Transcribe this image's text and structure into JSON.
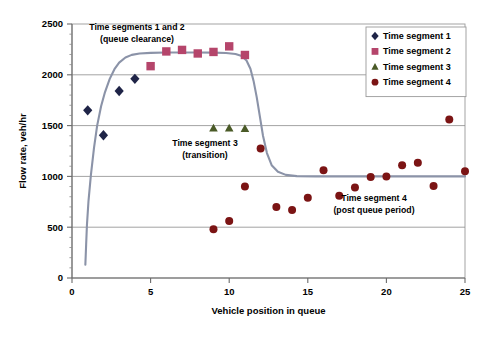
{
  "chart_data": {
    "type": "scatter",
    "title": "",
    "xlabel": "Vehicle position in queue",
    "ylabel": "Flow rate, veh/hr",
    "xlim": [
      0,
      25
    ],
    "ylim": [
      0,
      2500
    ],
    "xticks": [
      0,
      5,
      10,
      15,
      20,
      25
    ],
    "yticks": [
      0,
      500,
      1000,
      1500,
      2000,
      2500
    ],
    "xtick_labels": [
      "0",
      "5",
      "10",
      "15",
      "20",
      "25"
    ],
    "ytick_labels": [
      "0",
      "500",
      "1000",
      "1500",
      "2000",
      "2500"
    ],
    "grid": "horizontal",
    "legend_position": "top-right",
    "series": [
      {
        "name": "Time segment 1",
        "marker": "diamond",
        "color": "#1f2447",
        "points": [
          [
            1,
            1650
          ],
          [
            2,
            1405
          ],
          [
            3,
            1840
          ],
          [
            4,
            1960
          ]
        ]
      },
      {
        "name": "Time segment 2",
        "marker": "square",
        "color": "#b5456b",
        "points": [
          [
            5,
            2085
          ],
          [
            6,
            2230
          ],
          [
            7,
            2245
          ],
          [
            8,
            2210
          ],
          [
            9,
            2225
          ],
          [
            10,
            2280
          ],
          [
            11,
            2195
          ]
        ]
      },
      {
        "name": "Time segment 3",
        "marker": "triangle",
        "color": "#4a5a27",
        "points": [
          [
            9,
            1475
          ],
          [
            10,
            1475
          ],
          [
            11,
            1470
          ]
        ]
      },
      {
        "name": "Time segment 4",
        "marker": "circle",
        "color": "#7b1414",
        "points": [
          [
            9,
            480
          ],
          [
            10,
            560
          ],
          [
            11,
            900
          ],
          [
            12,
            1275
          ],
          [
            13,
            700
          ],
          [
            14,
            670
          ],
          [
            15,
            790
          ],
          [
            16,
            1060
          ],
          [
            17,
            810
          ],
          [
            18,
            890
          ],
          [
            19,
            995
          ],
          [
            20,
            1000
          ],
          [
            21,
            1110
          ],
          [
            22,
            1135
          ],
          [
            23,
            905
          ],
          [
            24,
            1560
          ],
          [
            25,
            1050
          ]
        ]
      }
    ],
    "fitted_curve": {
      "name": "fitted-curve",
      "color": "#8b93a8",
      "points": [
        [
          0.85,
          130
        ],
        [
          0.9,
          330
        ],
        [
          0.95,
          520
        ],
        [
          1.05,
          760
        ],
        [
          1.2,
          1010
        ],
        [
          1.4,
          1280
        ],
        [
          1.6,
          1500
        ],
        [
          1.85,
          1690
        ],
        [
          2.1,
          1830
        ],
        [
          2.4,
          1960
        ],
        [
          2.7,
          2055
        ],
        [
          3.0,
          2120
        ],
        [
          3.4,
          2170
        ],
        [
          3.8,
          2196
        ],
        [
          4.3,
          2210
        ],
        [
          5.0,
          2216
        ],
        [
          6.0,
          2219
        ],
        [
          7.0,
          2220
        ],
        [
          8.0,
          2220
        ],
        [
          9.0,
          2218
        ],
        [
          9.8,
          2214
        ],
        [
          10.4,
          2205
        ],
        [
          10.8,
          2185
        ],
        [
          11.1,
          2140
        ],
        [
          11.35,
          2060
        ],
        [
          11.55,
          1940
        ],
        [
          11.75,
          1780
        ],
        [
          11.95,
          1590
        ],
        [
          12.15,
          1400
        ],
        [
          12.4,
          1230
        ],
        [
          12.7,
          1110
        ],
        [
          13.1,
          1045
        ],
        [
          13.6,
          1015
        ],
        [
          14.3,
          1003
        ],
        [
          15.5,
          1000
        ],
        [
          18,
          1000
        ],
        [
          21,
          1000
        ],
        [
          25,
          1000
        ]
      ]
    },
    "annotations": [
      {
        "id": "ann-seg12",
        "line1": "Time segments 1 and 2",
        "line2": "(queue clearance)"
      },
      {
        "id": "ann-seg3",
        "line1": "Time segment 3",
        "line2": "(transition)"
      },
      {
        "id": "ann-seg4",
        "line1": "Time segment 4",
        "line2": "(post queue period)"
      }
    ],
    "legend_entries": [
      {
        "label": "Time segment 1",
        "marker": "diamond",
        "color": "#1f2447"
      },
      {
        "label": "Time segment 2",
        "marker": "square",
        "color": "#b5456b"
      },
      {
        "label": "Time segment 3",
        "marker": "triangle",
        "color": "#4a5a27"
      },
      {
        "label": "Time segment 4",
        "marker": "circle",
        "color": "#7b1414"
      }
    ]
  }
}
